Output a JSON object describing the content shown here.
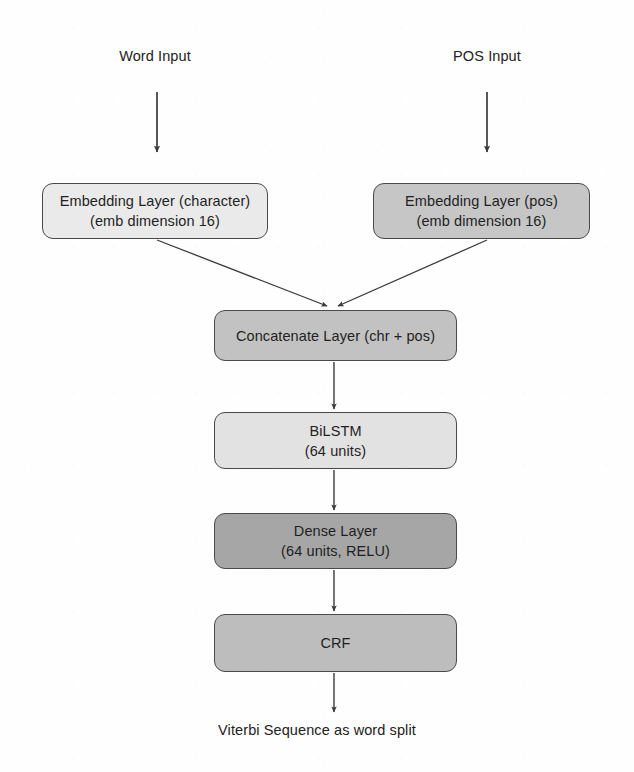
{
  "diagram": {
    "type": "flowchart",
    "orientation": "top-to-bottom",
    "colors": {
      "box_border": "#4a4a4a",
      "arrow": "#3a3a3a",
      "text": "#1f1f1f",
      "fill_light": "#e9e9e9",
      "fill_medium": "#c3c3c3",
      "fill_dark": "#a6a6a6",
      "background": "#fefefe"
    },
    "inputs": [
      {
        "id": "word-input",
        "label": "Word Input"
      },
      {
        "id": "pos-input",
        "label": "POS Input"
      }
    ],
    "nodes": [
      {
        "id": "embedding-character",
        "lines": [
          "Embedding Layer (character)",
          "(emb dimension 16)"
        ],
        "fill": "#eaeaea"
      },
      {
        "id": "embedding-pos",
        "lines": [
          "Embedding Layer (pos)",
          "(emb dimension 16)"
        ],
        "fill": "#c6c6c6"
      },
      {
        "id": "concatenate",
        "lines": [
          "Concatenate Layer (chr + pos)"
        ],
        "fill": "#c2c2c2"
      },
      {
        "id": "bilstm",
        "lines": [
          "BiLSTM",
          "(64 units)"
        ],
        "fill": "#e2e2e2"
      },
      {
        "id": "dense",
        "lines": [
          "Dense Layer",
          "(64 units, RELU)"
        ],
        "fill": "#a6a6a6"
      },
      {
        "id": "crf",
        "lines": [
          "CRF"
        ],
        "fill": "#bdbdbd"
      }
    ],
    "output": {
      "id": "output-label",
      "label": "Viterbi Sequence as word split"
    },
    "edges": [
      {
        "from": "word-input",
        "to": "embedding-character",
        "style": "straight-down"
      },
      {
        "from": "pos-input",
        "to": "embedding-pos",
        "style": "straight-down"
      },
      {
        "from": "embedding-character",
        "to": "concatenate",
        "style": "diagonal"
      },
      {
        "from": "embedding-pos",
        "to": "concatenate",
        "style": "diagonal"
      },
      {
        "from": "concatenate",
        "to": "bilstm",
        "style": "straight-down"
      },
      {
        "from": "bilstm",
        "to": "dense",
        "style": "straight-down"
      },
      {
        "from": "dense",
        "to": "crf",
        "style": "straight-down"
      },
      {
        "from": "crf",
        "to": "output-label",
        "style": "straight-down"
      }
    ]
  }
}
